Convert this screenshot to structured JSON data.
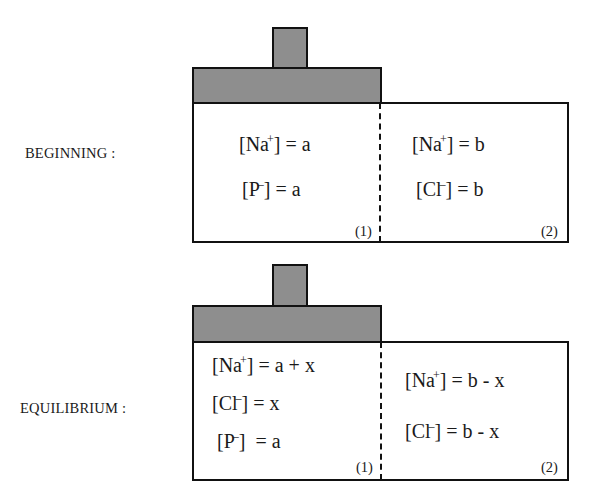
{
  "stages": [
    {
      "label": "BEGINNING :",
      "compartment1": {
        "id": "(1)",
        "lines": [
          {
            "ion": "Na",
            "charge": "+",
            "rest": "] = a"
          },
          {
            "ion": "P",
            "charge": "–",
            "rest": "] = a"
          }
        ]
      },
      "compartment2": {
        "id": "(2)",
        "lines": [
          {
            "ion": "Na",
            "charge": "+",
            "rest": "] = b"
          },
          {
            "ion": "Cl",
            "charge": "–",
            "rest": "] = b"
          }
        ]
      }
    },
    {
      "label": "EQUILIBRIUM :",
      "compartment1": {
        "id": "(1)",
        "lines": [
          {
            "ion": "Na",
            "charge": "+",
            "rest": "] = a + x"
          },
          {
            "ion": "Cl",
            "charge": "–",
            "rest": "] = x"
          },
          {
            "ion": "P",
            "charge": "–",
            "rest": "]  = a"
          }
        ]
      },
      "compartment2": {
        "id": "(2)",
        "lines": [
          {
            "ion": "Na",
            "charge": "+",
            "rest": "] = b - x"
          },
          {
            "ion": "Cl",
            "charge": "–",
            "rest": "] = b - x"
          }
        ]
      }
    }
  ],
  "colors": {
    "piston_fill": "#8e8e8e",
    "outline": "#111111"
  }
}
